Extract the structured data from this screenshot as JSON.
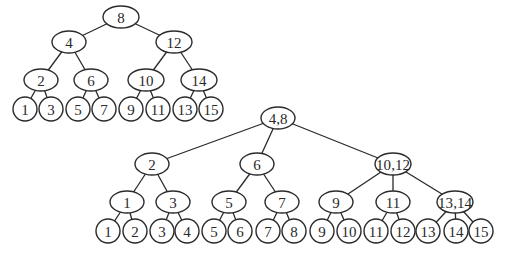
{
  "diagram": {
    "trees": [
      {
        "id": "binary-tree",
        "nodes": [
          {
            "id": "t1n8",
            "label": "8",
            "x": 121,
            "y": 17,
            "rx": 18,
            "ry": 11
          },
          {
            "id": "t1n4",
            "label": "4",
            "x": 69,
            "y": 42,
            "rx": 17,
            "ry": 11
          },
          {
            "id": "t1n12",
            "label": "12",
            "x": 174,
            "y": 42,
            "rx": 18,
            "ry": 11
          },
          {
            "id": "t1n2",
            "label": "2",
            "x": 41,
            "y": 80,
            "rx": 17,
            "ry": 11
          },
          {
            "id": "t1n6",
            "label": "6",
            "x": 91,
            "y": 80,
            "rx": 17,
            "ry": 11
          },
          {
            "id": "t1n10",
            "label": "10",
            "x": 146,
            "y": 80,
            "rx": 18,
            "ry": 11
          },
          {
            "id": "t1n14",
            "label": "14",
            "x": 199,
            "y": 80,
            "rx": 18,
            "ry": 11
          },
          {
            "id": "t1l1",
            "label": "1",
            "x": 25,
            "y": 109,
            "rx": 12,
            "ry": 12
          },
          {
            "id": "t1l3",
            "label": "3",
            "x": 51,
            "y": 109,
            "rx": 12,
            "ry": 12
          },
          {
            "id": "t1l5",
            "label": "5",
            "x": 78,
            "y": 109,
            "rx": 12,
            "ry": 12
          },
          {
            "id": "t1l7",
            "label": "7",
            "x": 104,
            "y": 109,
            "rx": 12,
            "ry": 12
          },
          {
            "id": "t1l9",
            "label": "9",
            "x": 131,
            "y": 109,
            "rx": 12,
            "ry": 12
          },
          {
            "id": "t1l11",
            "label": "11",
            "x": 158,
            "y": 109,
            "rx": 12,
            "ry": 12
          },
          {
            "id": "t1l13",
            "label": "13",
            "x": 185,
            "y": 109,
            "rx": 12,
            "ry": 12
          },
          {
            "id": "t1l15",
            "label": "15",
            "x": 211,
            "y": 109,
            "rx": 12,
            "ry": 12
          }
        ],
        "edges": [
          [
            "t1n8",
            "t1n4"
          ],
          [
            "t1n8",
            "t1n12"
          ],
          [
            "t1n4",
            "t1n2"
          ],
          [
            "t1n4",
            "t1n6"
          ],
          [
            "t1n12",
            "t1n10"
          ],
          [
            "t1n12",
            "t1n14"
          ],
          [
            "t1n2",
            "t1l1"
          ],
          [
            "t1n2",
            "t1l3"
          ],
          [
            "t1n6",
            "t1l5"
          ],
          [
            "t1n6",
            "t1l7"
          ],
          [
            "t1n10",
            "t1l9"
          ],
          [
            "t1n10",
            "t1l11"
          ],
          [
            "t1n14",
            "t1l13"
          ],
          [
            "t1n14",
            "t1l15"
          ]
        ]
      },
      {
        "id": "multiway-tree",
        "nodes": [
          {
            "id": "t2r",
            "label": "4,8",
            "x": 278,
            "y": 118,
            "rx": 17,
            "ry": 11
          },
          {
            "id": "t2a",
            "label": "2",
            "x": 152,
            "y": 164,
            "rx": 17,
            "ry": 11
          },
          {
            "id": "t2b",
            "label": "6",
            "x": 257,
            "y": 164,
            "rx": 17,
            "ry": 11
          },
          {
            "id": "t2c",
            "label": "10,12",
            "x": 393,
            "y": 164,
            "rx": 18,
            "ry": 11
          },
          {
            "id": "t2a1",
            "label": "1",
            "x": 127,
            "y": 202,
            "rx": 17,
            "ry": 11
          },
          {
            "id": "t2a3",
            "label": "3",
            "x": 173,
            "y": 202,
            "rx": 17,
            "ry": 11
          },
          {
            "id": "t2b5",
            "label": "5",
            "x": 229,
            "y": 202,
            "rx": 17,
            "ry": 11
          },
          {
            "id": "t2b7",
            "label": "7",
            "x": 282,
            "y": 202,
            "rx": 17,
            "ry": 11
          },
          {
            "id": "t2c9",
            "label": "9",
            "x": 336,
            "y": 202,
            "rx": 17,
            "ry": 11
          },
          {
            "id": "t2c11",
            "label": "11",
            "x": 393,
            "y": 202,
            "rx": 17,
            "ry": 11
          },
          {
            "id": "t2c13",
            "label": "13,14",
            "x": 455,
            "y": 202,
            "rx": 18,
            "ry": 11
          },
          {
            "id": "t2l1",
            "label": "1",
            "x": 108,
            "y": 231,
            "rx": 12,
            "ry": 12
          },
          {
            "id": "t2l2",
            "label": "2",
            "x": 135,
            "y": 231,
            "rx": 12,
            "ry": 12
          },
          {
            "id": "t2l3",
            "label": "3",
            "x": 162,
            "y": 231,
            "rx": 12,
            "ry": 12
          },
          {
            "id": "t2l4",
            "label": "4",
            "x": 187,
            "y": 231,
            "rx": 12,
            "ry": 12
          },
          {
            "id": "t2l5",
            "label": "5",
            "x": 214,
            "y": 231,
            "rx": 12,
            "ry": 12
          },
          {
            "id": "t2l6",
            "label": "6",
            "x": 240,
            "y": 231,
            "rx": 12,
            "ry": 12
          },
          {
            "id": "t2l7",
            "label": "7",
            "x": 268,
            "y": 231,
            "rx": 12,
            "ry": 12
          },
          {
            "id": "t2l8",
            "label": "8",
            "x": 294,
            "y": 231,
            "rx": 12,
            "ry": 12
          },
          {
            "id": "t2l9",
            "label": "9",
            "x": 322,
            "y": 231,
            "rx": 12,
            "ry": 12
          },
          {
            "id": "t2l10",
            "label": "10",
            "x": 349,
            "y": 231,
            "rx": 12,
            "ry": 12
          },
          {
            "id": "t2l11",
            "label": "11",
            "x": 376,
            "y": 231,
            "rx": 12,
            "ry": 12
          },
          {
            "id": "t2l12",
            "label": "12",
            "x": 403,
            "y": 231,
            "rx": 12,
            "ry": 12
          },
          {
            "id": "t2l13",
            "label": "13",
            "x": 428,
            "y": 231,
            "rx": 12,
            "ry": 12
          },
          {
            "id": "t2l14",
            "label": "14",
            "x": 456,
            "y": 231,
            "rx": 12,
            "ry": 12
          },
          {
            "id": "t2l15",
            "label": "15",
            "x": 481,
            "y": 231,
            "rx": 12,
            "ry": 12
          }
        ],
        "edges": [
          [
            "t2r",
            "t2a"
          ],
          [
            "t2r",
            "t2b"
          ],
          [
            "t2r",
            "t2c"
          ],
          [
            "t2a",
            "t2a1"
          ],
          [
            "t2a",
            "t2a3"
          ],
          [
            "t2b",
            "t2b5"
          ],
          [
            "t2b",
            "t2b7"
          ],
          [
            "t2c",
            "t2c9"
          ],
          [
            "t2c",
            "t2c11"
          ],
          [
            "t2c",
            "t2c13"
          ],
          [
            "t2a1",
            "t2l1"
          ],
          [
            "t2a1",
            "t2l2"
          ],
          [
            "t2a3",
            "t2l3"
          ],
          [
            "t2a3",
            "t2l4"
          ],
          [
            "t2b5",
            "t2l5"
          ],
          [
            "t2b5",
            "t2l6"
          ],
          [
            "t2b7",
            "t2l7"
          ],
          [
            "t2b7",
            "t2l8"
          ],
          [
            "t2c9",
            "t2l9"
          ],
          [
            "t2c9",
            "t2l10"
          ],
          [
            "t2c11",
            "t2l11"
          ],
          [
            "t2c11",
            "t2l12"
          ],
          [
            "t2c13",
            "t2l13"
          ],
          [
            "t2c13",
            "t2l14"
          ],
          [
            "t2c13",
            "t2l15"
          ]
        ]
      }
    ]
  }
}
